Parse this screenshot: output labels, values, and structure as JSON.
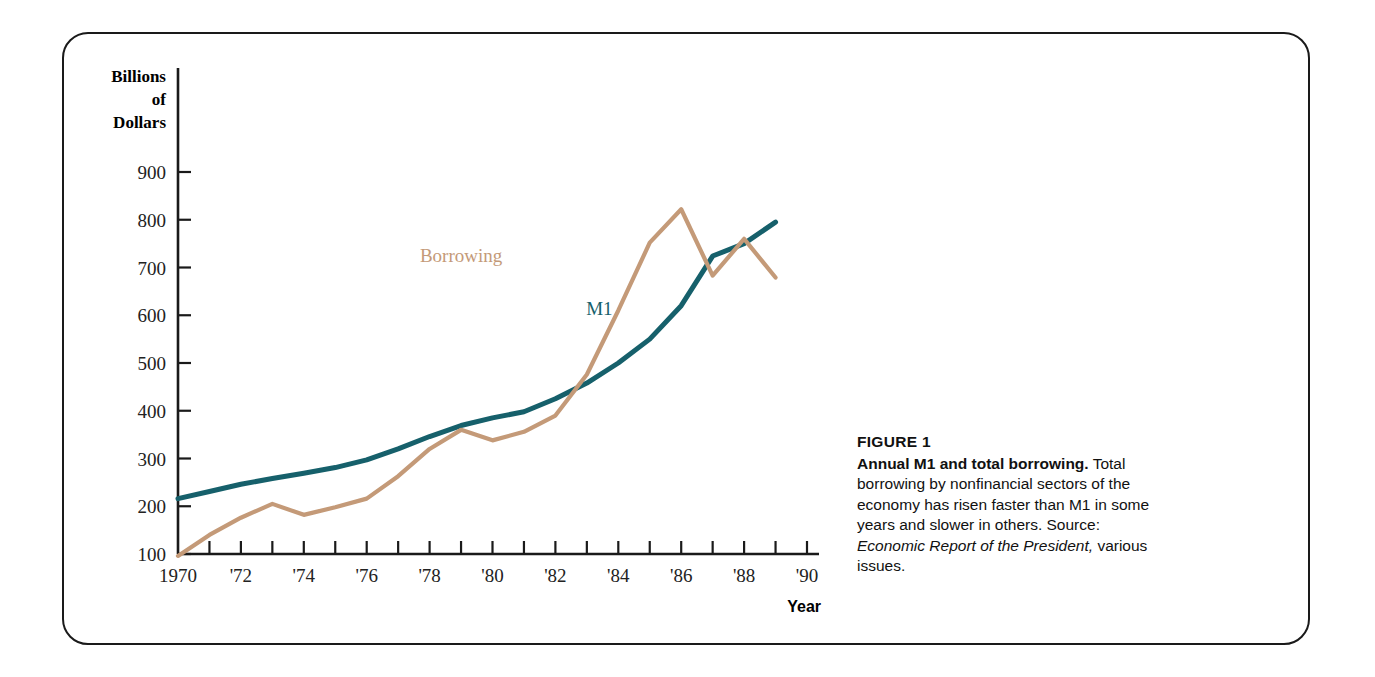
{
  "figure": {
    "number_label": "FIGURE 1",
    "caption_bold": "Annual M1 and total borrowing.",
    "caption_text_1": " Total borrowing by nonfinancial sectors of the economy has risen faster than M1 in some years and slower in others.  Source: ",
    "caption_source_italic": "Economic Report of the President,",
    "caption_text_2": " various issues."
  },
  "colors": {
    "m1": "#16606b",
    "borrowing": "#c49a78",
    "axis": "#1a1a1a",
    "frame": "#1a1a1a",
    "tick_text": "#222222"
  },
  "chart_data": {
    "type": "line",
    "title": "Annual M1 and total borrowing",
    "xlabel": "Year",
    "ylabel": "Billions of Dollars",
    "ylabel_lines": [
      "Billions",
      "of",
      "Dollars"
    ],
    "xlim": [
      1970,
      1990
    ],
    "ylim": [
      100,
      900
    ],
    "ytick_values": [
      900,
      800,
      700,
      600,
      500,
      400,
      300,
      200,
      100
    ],
    "ytick_labels": [
      "900",
      "800",
      "700",
      "600",
      "500",
      "400",
      "300",
      "200",
      "100"
    ],
    "xtick_values": [
      1970,
      1971,
      1972,
      1973,
      1974,
      1975,
      1976,
      1977,
      1978,
      1979,
      1980,
      1981,
      1982,
      1983,
      1984,
      1985,
      1986,
      1987,
      1988,
      1989,
      1990
    ],
    "xtick_labeled": [
      {
        "value": 1970,
        "label": "1970"
      },
      {
        "value": 1972,
        "label": "'72"
      },
      {
        "value": 1974,
        "label": "'74"
      },
      {
        "value": 1976,
        "label": "'76"
      },
      {
        "value": 1978,
        "label": "'78"
      },
      {
        "value": 1980,
        "label": "'80"
      },
      {
        "value": 1982,
        "label": "'82"
      },
      {
        "value": 1984,
        "label": "'84"
      },
      {
        "value": 1986,
        "label": "'86"
      },
      {
        "value": 1988,
        "label": "'88"
      },
      {
        "value": 1990,
        "label": "'90"
      }
    ],
    "grid": false,
    "legend": "inline-annotations",
    "x": [
      1970,
      1971,
      1972,
      1973,
      1974,
      1975,
      1976,
      1977,
      1978,
      1979,
      1980,
      1981,
      1982,
      1983,
      1984,
      1985,
      1986,
      1987,
      1988,
      1989
    ],
    "series": [
      {
        "name": "M1",
        "color": "#16606b",
        "label_x": 1983.4,
        "label_y": 600,
        "values": [
          216,
          231,
          246,
          258,
          269,
          281,
          297,
          320,
          346,
          369,
          385,
          398,
          425,
          458,
          500,
          550,
          620,
          724,
          750,
          795
        ]
      },
      {
        "name": "Borrowing",
        "color": "#c49a78",
        "label_x": 1979.0,
        "label_y": 712,
        "values": [
          96,
          140,
          176,
          205,
          182,
          198,
          216,
          263,
          320,
          360,
          338,
          356,
          390,
          476,
          610,
          752,
          822,
          683,
          760,
          679
        ]
      }
    ],
    "annotations": [
      {
        "text": "Borrowing",
        "color": "#c49a78"
      },
      {
        "text": "M1",
        "color": "#16606b"
      }
    ]
  }
}
